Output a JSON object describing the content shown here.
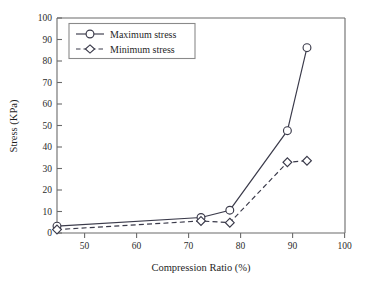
{
  "chart_data": {
    "type": "line",
    "title": "",
    "xlabel": "Compression Ratio (%)",
    "ylabel": "Stress (KPa)",
    "xlim": [
      50,
      100
    ],
    "ylim": [
      0,
      100
    ],
    "xticks": [
      50,
      60,
      70,
      80,
      90,
      100
    ],
    "yticks": [
      0,
      10,
      20,
      30,
      40,
      50,
      60,
      70,
      80,
      90,
      100
    ],
    "grid": false,
    "legend_position": "upper left",
    "series": [
      {
        "name": "Maximum stress",
        "marker": "circle-open",
        "linestyle": "solid",
        "x": [
          50,
          75,
          80,
          90,
          93.4
        ],
        "values": [
          3.2,
          7.2,
          10.6,
          47.6,
          86.2
        ]
      },
      {
        "name": "Minimum stress",
        "marker": "diamond-open",
        "linestyle": "dashed",
        "x": [
          50,
          75,
          80,
          90,
          93.4
        ],
        "values": [
          1.6,
          5.6,
          4.8,
          32.9,
          33.6
        ]
      }
    ]
  },
  "axes": {
    "x_title": "Compression Ratio (%)",
    "y_title": "Stress (KPa)",
    "x_tick_labels": [
      "50",
      "60",
      "70",
      "80",
      "90",
      "100"
    ],
    "y_tick_labels": [
      "0",
      "10",
      "20",
      "30",
      "40",
      "50",
      "60",
      "70",
      "80",
      "90",
      "100"
    ]
  },
  "legend": {
    "items": [
      {
        "label": "Maximum stress",
        "marker": "circle-open",
        "linestyle": "solid"
      },
      {
        "label": "Minimum stress",
        "marker": "diamond-open",
        "linestyle": "dashed"
      }
    ]
  },
  "colors": {
    "line": "#3a3a4a",
    "axis": "#6b6b6b",
    "text": "#1f1f1f",
    "background": "#ffffff",
    "marker_fill": "#ffffff",
    "legend_border": "#8a8a8a"
  }
}
